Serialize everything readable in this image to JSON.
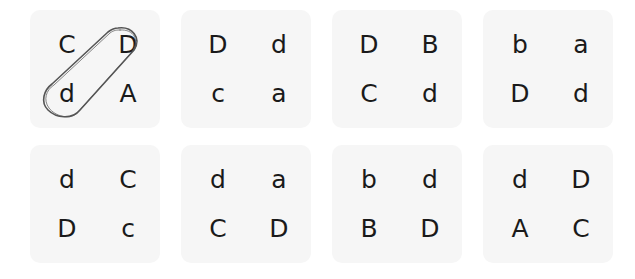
{
  "cards": [
    {
      "tl": "C",
      "tr": "D",
      "bl": "d",
      "br": "A",
      "circled": "tr-bl"
    },
    {
      "tl": "D",
      "tr": "d",
      "bl": "c",
      "br": "a"
    },
    {
      "tl": "D",
      "tr": "B",
      "bl": "C",
      "br": "d"
    },
    {
      "tl": "b",
      "tr": "a",
      "bl": "D",
      "br": "d"
    },
    {
      "tl": "d",
      "tr": "C",
      "bl": "D",
      "br": "c"
    },
    {
      "tl": "d",
      "tr": "a",
      "bl": "C",
      "br": "D"
    },
    {
      "tl": "b",
      "tr": "d",
      "bl": "B",
      "br": "D"
    },
    {
      "tl": "d",
      "tr": "D",
      "bl": "A",
      "br": "C"
    }
  ],
  "annotation": {
    "type": "hand-drawn loop",
    "card_index": 0,
    "connects": [
      "D",
      "d"
    ],
    "color": "#555555"
  }
}
